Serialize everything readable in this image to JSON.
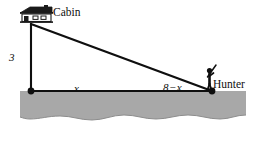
{
  "figure": {
    "title": "",
    "labels": {
      "cabin": "Cabin",
      "hunter": "Hunter",
      "height": "3",
      "base_near": "x",
      "base_far_value": "8",
      "base_far_operator": "−",
      "base_far_variable": "x",
      "base_far": "8 − x"
    },
    "icons": {
      "cabin": "cabin-house-icon",
      "hunter": "hunter-stick-figure-icon"
    },
    "colors": {
      "stroke": "#0f0f0f",
      "ground_fill": "#a8a8a8",
      "ground_edge": "#6f6f6f",
      "background": "#ffffff",
      "text": "#0f0f0f"
    },
    "geometry": {
      "apex": [
        31,
        24
      ],
      "left_vertex": [
        31,
        91
      ],
      "right_vertex": [
        212,
        91
      ],
      "ground_top_y": 91,
      "ground_bottom_y": 122,
      "vertical_side": "3",
      "horizontal_segment_near": "x",
      "horizontal_segment_far": "8 - x"
    }
  }
}
